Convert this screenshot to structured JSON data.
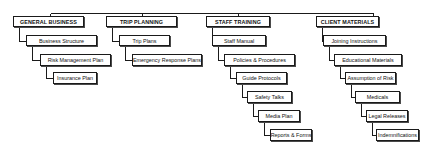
{
  "diagram": {
    "type": "hierarchy",
    "columns": [
      {
        "heading": "GENERAL BUSINESS",
        "items": [
          "Business Structure",
          "Risk Management Plan",
          "Insurance Plan"
        ]
      },
      {
        "heading": "TRIP PLANNING",
        "items": [
          "Trip Plans",
          "Emergency Response Plans"
        ]
      },
      {
        "heading": "STAFF TRAINING",
        "items": [
          "Staff Manual",
          "Policies & Procedures",
          "Guide Protocols",
          "Safety Talks",
          "Media Plan",
          "Reports & Forms"
        ]
      },
      {
        "heading": "CLIENT MATERIALS",
        "items": [
          "Joining Instructions",
          "Educational Materials",
          "Assumption of Risk",
          "Medicals",
          "Legal Releases",
          "Indemnifications"
        ]
      }
    ]
  }
}
